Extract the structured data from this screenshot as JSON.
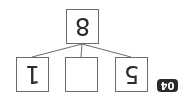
{
  "diagram": {
    "orientation": "rotated-180",
    "problem_number": "04",
    "top_node": {
      "value": "8"
    },
    "children": [
      {
        "value": "5"
      },
      {
        "value": ""
      },
      {
        "value": "1"
      }
    ],
    "colors": {
      "border": "#6b6b6b",
      "text": "#2b2b2b",
      "badge_bg": "#2a2a2a",
      "badge_text": "#ffffff"
    }
  }
}
